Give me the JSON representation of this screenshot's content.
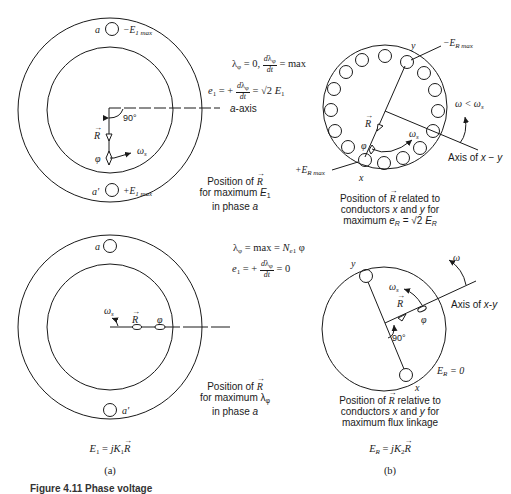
{
  "figure": {
    "caption_visible": "Figure 4.11  Phase voltage",
    "panel_a": {
      "label": "(a)",
      "equation": "E1 = jK1 R",
      "top": {
        "eq1": "λφ = 0, dλφ/dt = max",
        "eq2": "e1 = +dλφ/dt = √2 E1",
        "axis_label": "a-axis",
        "slot_top_label": "a",
        "slot_top_emf": "-E1max",
        "slot_bottom_label": "a'",
        "slot_bottom_emf": "+E1max",
        "angle": "90°",
        "vector_R": "R",
        "flux": "φ",
        "speed": "ωs",
        "caption_line1": "Position of R",
        "caption_line2": "for maximum E1",
        "caption_line3": "in phase a"
      },
      "bottom": {
        "eq1": "λφ = max = Ne1 φ",
        "eq2": "e1 = +dλφ/dt = 0",
        "slot_top_label": "a",
        "slot_bottom_label": "a'",
        "vector_R": "R",
        "flux": "φ",
        "speed": "ωs",
        "caption_line1": "Position of R",
        "caption_line2": "for maximum λφ",
        "caption_line3": "in phase a"
      }
    },
    "panel_b": {
      "label": "(b)",
      "equation": "ER = jK2 R",
      "top": {
        "slot_count": 16,
        "conductor_y": "y",
        "conductor_x": "x",
        "emf_y": "-ER max",
        "emf_x": "+ER max",
        "rotor_speed": "ω < ωs",
        "speed": "ωs",
        "axis_label": "Axis of x - y",
        "vector_R": "R",
        "flux": "φ",
        "caption_line1": "Position of R related to",
        "caption_line2": "conductors x and y for",
        "caption_line3": "maximum eR = √2 ER"
      },
      "bottom": {
        "conductor_y": "y",
        "conductor_x": "x",
        "emf": "ER = 0",
        "rotor_speed": "ω",
        "speed": "ωs",
        "axis_label": "Axis of x-y",
        "angle": "90°",
        "vector_R": "R",
        "flux": "φ",
        "caption_line1": "Position of R relative to",
        "caption_line2": "conductors x and y for",
        "caption_line3": "maximum flux linkage"
      }
    },
    "colors": {
      "ink": "#1a1a1a",
      "background": "#ffffff"
    }
  }
}
